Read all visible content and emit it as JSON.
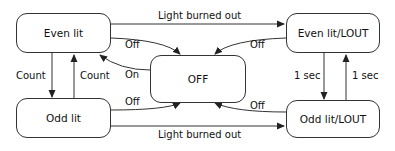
{
  "diagram": {
    "type": "state-machine",
    "states": {
      "even_lit": "Even lit",
      "even_lit_lout": "Even lit/LOUT",
      "off": "OFF",
      "odd_lit": "Odd lit",
      "odd_lit_lout": "Odd lit/LOUT"
    },
    "transitions": {
      "even_to_evenlout": "Light burned out",
      "odd_to_oddlout": "Light burned out",
      "even_to_off": "Off",
      "evenlout_to_off": "Off",
      "off_to_even": "On",
      "odd_to_off": "Off",
      "oddlout_to_off": "Off",
      "even_to_odd": "Count",
      "odd_to_even": "Count",
      "evenlout_to_oddlout": "1 sec",
      "oddlout_to_evenlout": "1 sec"
    },
    "line_color": "#333333"
  }
}
